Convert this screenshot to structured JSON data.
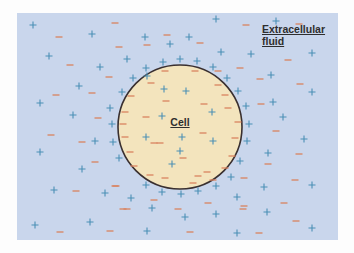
{
  "labels": {
    "extracellular_line1": "Extracellular",
    "extracellular_line2": "fluid",
    "cell": "Cell"
  },
  "colors": {
    "extracellular_fluid": "#c9d6ec",
    "cell_fill": "#f3e4bd",
    "membrane": "#3a3030",
    "positive_ion": "#4a8fb5",
    "negative_ion": "#d9835f"
  },
  "cell": {
    "cx": 180,
    "cy": 127,
    "r": 62
  },
  "ions": {
    "outside_plus": [
      [
        33,
        25
      ],
      [
        92,
        34
      ],
      [
        49,
        56
      ],
      [
        100,
        67
      ],
      [
        79,
        86
      ],
      [
        40,
        103
      ],
      [
        73,
        115
      ],
      [
        110,
        108
      ],
      [
        112,
        124
      ],
      [
        122,
        92
      ],
      [
        95,
        141
      ],
      [
        113,
        142
      ],
      [
        40,
        152
      ],
      [
        119,
        158
      ],
      [
        82,
        169
      ],
      [
        54,
        190
      ],
      [
        105,
        193
      ],
      [
        35,
        225
      ],
      [
        90,
        222
      ],
      [
        216,
        19
      ],
      [
        145,
        37
      ],
      [
        170,
        44
      ],
      [
        189,
        37
      ],
      [
        221,
        52
      ],
      [
        127,
        59
      ],
      [
        163,
        62
      ],
      [
        180,
        59
      ],
      [
        197,
        61
      ],
      [
        146,
        68
      ],
      [
        213,
        67
      ],
      [
        276,
        21
      ],
      [
        251,
        54
      ],
      [
        312,
        53
      ],
      [
        271,
        75
      ],
      [
        238,
        91
      ],
      [
        312,
        92
      ],
      [
        246,
        106
      ],
      [
        273,
        102
      ],
      [
        283,
        117
      ],
      [
        249,
        124
      ],
      [
        247,
        141
      ],
      [
        304,
        139
      ],
      [
        268,
        153
      ],
      [
        240,
        161
      ],
      [
        264,
        187
      ],
      [
        312,
        185
      ],
      [
        237,
        197
      ],
      [
        267,
        212
      ],
      [
        312,
        228
      ],
      [
        237,
        233
      ],
      [
        146,
        185
      ],
      [
        162,
        192
      ],
      [
        181,
        194
      ],
      [
        198,
        191
      ],
      [
        216,
        186
      ],
      [
        231,
        177
      ],
      [
        131,
        198
      ],
      [
        152,
        208
      ],
      [
        185,
        217
      ],
      [
        216,
        214
      ],
      [
        147,
        231
      ]
    ],
    "outside_minus": [
      [
        59,
        37
      ],
      [
        115,
        23
      ],
      [
        119,
        47
      ],
      [
        70,
        65
      ],
      [
        109,
        77
      ],
      [
        56,
        95
      ],
      [
        92,
        93
      ],
      [
        98,
        118
      ],
      [
        51,
        135
      ],
      [
        82,
        142
      ],
      [
        95,
        162
      ],
      [
        76,
        191
      ],
      [
        115,
        186
      ],
      [
        60,
        232
      ],
      [
        110,
        231
      ],
      [
        123,
        209
      ],
      [
        167,
        35
      ],
      [
        147,
        45
      ],
      [
        200,
        43
      ],
      [
        246,
        25
      ],
      [
        299,
        24
      ],
      [
        288,
        60
      ],
      [
        240,
        68
      ],
      [
        260,
        79
      ],
      [
        300,
        84
      ],
      [
        261,
        104
      ],
      [
        276,
        131
      ],
      [
        299,
        154
      ],
      [
        268,
        164
      ],
      [
        244,
        178
      ],
      [
        295,
        180
      ],
      [
        244,
        206
      ],
      [
        284,
        203
      ],
      [
        296,
        221
      ],
      [
        259,
        233
      ],
      [
        116,
        186
      ],
      [
        154,
        200
      ],
      [
        127,
        209
      ],
      [
        178,
        209
      ],
      [
        208,
        203
      ],
      [
        243,
        209
      ],
      [
        190,
        232
      ]
    ],
    "inside_plus": [
      [
        164,
        89
      ],
      [
        133,
        78
      ],
      [
        147,
        76
      ],
      [
        162,
        116
      ],
      [
        186,
        91
      ],
      [
        227,
        78
      ],
      [
        212,
        112
      ],
      [
        146,
        137
      ],
      [
        182,
        137
      ],
      [
        213,
        141
      ],
      [
        172,
        164
      ],
      [
        180,
        151
      ]
    ],
    "inside_minus": [
      [
        165,
        71
      ],
      [
        151,
        83
      ],
      [
        131,
        96
      ],
      [
        166,
        101
      ],
      [
        125,
        112
      ],
      [
        146,
        117
      ],
      [
        123,
        124
      ],
      [
        195,
        71
      ],
      [
        218,
        71
      ],
      [
        218,
        85
      ],
      [
        225,
        95
      ],
      [
        228,
        108
      ],
      [
        204,
        104
      ],
      [
        238,
        122
      ],
      [
        125,
        137
      ],
      [
        154,
        143
      ],
      [
        160,
        143
      ],
      [
        203,
        133
      ],
      [
        235,
        138
      ],
      [
        130,
        152
      ],
      [
        232,
        156
      ],
      [
        183,
        158
      ],
      [
        134,
        166
      ],
      [
        225,
        168
      ],
      [
        150,
        175
      ],
      [
        165,
        178
      ],
      [
        193,
        183
      ],
      [
        213,
        180
      ],
      [
        207,
        172
      ],
      [
        198,
        176
      ]
    ]
  }
}
